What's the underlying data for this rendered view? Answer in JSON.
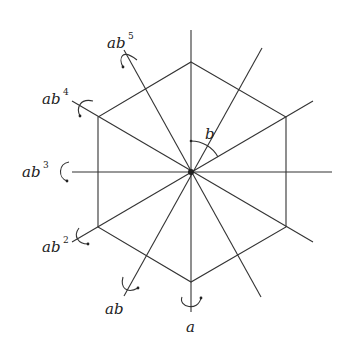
{
  "diagram": {
    "center": {
      "x": 191,
      "y": 172
    },
    "hexagon_vertices": [
      [
        191,
        62
      ],
      [
        286,
        117
      ],
      [
        286,
        227
      ],
      [
        191,
        282
      ],
      [
        98,
        227
      ],
      [
        98,
        117
      ]
    ],
    "rotation": {
      "label": "b",
      "description": "rotation about center"
    },
    "axes": [
      {
        "label": "a",
        "base": "a",
        "exp": ""
      },
      {
        "label": "ab",
        "base": "ab",
        "exp": ""
      },
      {
        "label": "ab²",
        "base": "ab",
        "exp": "2"
      },
      {
        "label": "ab³",
        "base": "ab",
        "exp": "3"
      },
      {
        "label": "ab⁴",
        "base": "ab",
        "exp": "4"
      },
      {
        "label": "ab⁵",
        "base": "ab",
        "exp": "5"
      }
    ],
    "colors": {
      "line": "#333333",
      "background": "#ffffff"
    }
  }
}
